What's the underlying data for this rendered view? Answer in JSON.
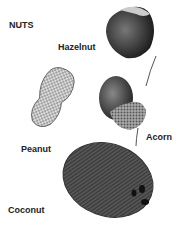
{
  "title": "NUTS",
  "labels": {
    "hazelnut": "Hazelnut",
    "peanut": "Peanut",
    "acorn": "Acorn",
    "coconut": "Coconut"
  }
}
